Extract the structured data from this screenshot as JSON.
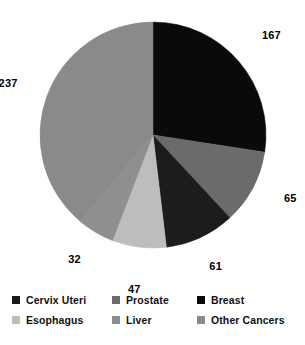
{
  "chart_data": {
    "type": "pie",
    "title": "",
    "xlabel": "",
    "ylabel": "",
    "total": 609,
    "start_angle_deg": 0,
    "direction": "clockwise",
    "grid": false,
    "legend_position": "bottom",
    "categories": [
      "Breast",
      "Prostate",
      "Cervix Uteri",
      "Esophagus",
      "Liver",
      "Other Cancers"
    ],
    "values": [
      167,
      65,
      61,
      47,
      32,
      237
    ],
    "colors": [
      "#0a0a0a",
      "#6b6b6b",
      "#1c1c1c",
      "#bdbdbd",
      "#8f8f8f",
      "#8a8a8a"
    ],
    "slices": [
      {
        "label": "Breast",
        "value": 167,
        "value_text": "167",
        "color": "#0a0a0a"
      },
      {
        "label": "Prostate",
        "value": 65,
        "value_text": "65",
        "color": "#6b6b6b"
      },
      {
        "label": "Cervix Uteri",
        "value": 61,
        "value_text": "61",
        "color": "#1c1c1c"
      },
      {
        "label": "Esophagus",
        "value": 47,
        "value_text": "47",
        "color": "#bdbdbd"
      },
      {
        "label": "Liver",
        "value": 32,
        "value_text": "32",
        "color": "#8f8f8f"
      },
      {
        "label": "Other Cancers",
        "value": 237,
        "value_text": "237",
        "color": "#8a8a8a"
      }
    ],
    "data_labels": [
      "167",
      "65",
      "61",
      "47",
      "32",
      "237"
    ]
  },
  "legend": {
    "rows": [
      [
        {
          "label": "Cervix Uteri",
          "color": "#1c1c1c"
        },
        {
          "label": "Prostate",
          "color": "#6b6b6b"
        },
        {
          "label": "Breast",
          "color": "#0a0a0a"
        }
      ],
      [
        {
          "label": "Esophagus",
          "color": "#bdbdbd"
        },
        {
          "label": "Liver",
          "color": "#8f8f8f"
        },
        {
          "label": "Other Cancers",
          "color": "#8a8a8a"
        }
      ]
    ]
  }
}
